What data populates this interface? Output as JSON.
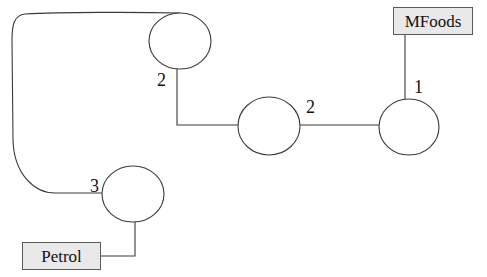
{
  "diagram": {
    "type": "network",
    "terminals": [
      {
        "id": "mfoods",
        "label": "MFoods"
      },
      {
        "id": "petrol",
        "label": "Petrol"
      }
    ],
    "nodes": [
      {
        "id": "n-top"
      },
      {
        "id": "n-middle"
      },
      {
        "id": "n-right"
      },
      {
        "id": "n-bottom-left"
      }
    ],
    "edges": [
      {
        "from": "mfoods",
        "to": "n-right",
        "label": "1"
      },
      {
        "from": "n-right",
        "to": "n-middle",
        "label": "2"
      },
      {
        "from": "n-middle",
        "to": "n-top",
        "label": "2"
      },
      {
        "from": "n-top",
        "to": "n-bottom-left",
        "label": "3"
      },
      {
        "from": "n-bottom-left",
        "to": "petrol",
        "label": ""
      }
    ],
    "edge_labels": {
      "mfoods_right": "1",
      "right_middle": "2",
      "middle_top": "2",
      "top_bottomleft": "3"
    },
    "colors": {
      "stroke": "#3a3a3a",
      "box_fill": "#e9e9e9",
      "box_border": "#5a5a5a",
      "text": "#111111"
    }
  }
}
